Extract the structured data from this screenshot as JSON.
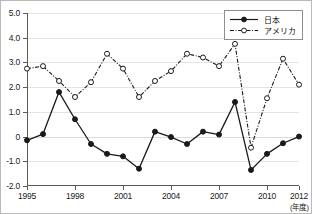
{
  "chart_data": {
    "type": "line",
    "title": "",
    "subtitle": "",
    "xlabel": "(年度)",
    "ylabel": "",
    "x": [
      1995,
      1996,
      1997,
      1998,
      1999,
      2000,
      2001,
      2002,
      2003,
      2004,
      2005,
      2006,
      2007,
      2008,
      2009,
      2010,
      2011,
      2012
    ],
    "xtick_labels": [
      "1995",
      "1998",
      "2001",
      "2004",
      "2007",
      "2010",
      "2012"
    ],
    "xticks": [
      1995,
      1998,
      2001,
      2004,
      2007,
      2010,
      2012
    ],
    "ytick_labels": [
      "5.0",
      "4.0",
      "3.0",
      "2.0",
      "1.0",
      "0",
      "-1.0",
      "-2.0"
    ],
    "yticks": [
      5.0,
      4.0,
      3.0,
      2.0,
      1.0,
      0,
      -1.0,
      -2.0
    ],
    "xlim": [
      1995,
      2012
    ],
    "ylim": [
      -2.0,
      5.0
    ],
    "grid": true,
    "legend_position": "top-right",
    "series": [
      {
        "name": "日本",
        "marker": "filled-circle",
        "linestyle": "solid",
        "color": "#1a1a1a",
        "values": [
          -0.15,
          0.1,
          1.8,
          0.7,
          -0.3,
          -0.7,
          -0.8,
          -1.3,
          0.2,
          -0.02,
          -0.3,
          0.2,
          0.08,
          1.4,
          -1.35,
          -0.7,
          -0.27,
          0.0
        ]
      },
      {
        "name": "アメリカ",
        "marker": "open-circle",
        "linestyle": "dash-dot",
        "color": "#1a1a1a",
        "values": [
          2.75,
          2.85,
          2.25,
          1.6,
          2.2,
          3.35,
          2.75,
          1.6,
          2.25,
          2.65,
          3.35,
          3.2,
          2.85,
          3.75,
          -0.45,
          1.55,
          3.15,
          2.1
        ]
      }
    ]
  },
  "legend": {
    "items": [
      {
        "label": "日本"
      },
      {
        "label": "アメリカ"
      }
    ]
  },
  "axis": {
    "unit_note": "(年度)"
  }
}
